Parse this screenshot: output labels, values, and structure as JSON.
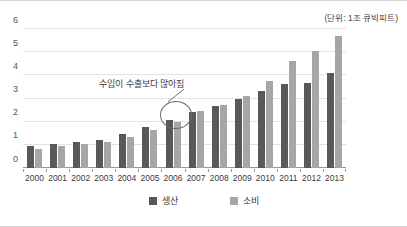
{
  "unit_caption": "(단위: 1조 큐빅피트)",
  "legend": {
    "production_label": "생산",
    "consumption_label": "소비"
  },
  "annotation": {
    "text": "수입이 수출보다 많아짐",
    "target_category": "2007"
  },
  "colors": {
    "production": "#595959",
    "consumption": "#a6a6a6",
    "gridline": "#e2e2e2",
    "axis": "#9a9a9a",
    "frame": "#d4d4d4"
  },
  "chart_data": {
    "type": "bar",
    "title": "",
    "subtitle": "",
    "xlabel": "",
    "ylabel": "",
    "unit": "(단위: 1조 큐빅피트)",
    "ylim": [
      0,
      6
    ],
    "yticks": [
      0,
      1,
      2,
      3,
      4,
      5,
      6
    ],
    "grid": true,
    "legend_position": "bottom",
    "categories": [
      "2000",
      "2001",
      "2002",
      "2003",
      "2004",
      "2005",
      "2006",
      "2007",
      "2008",
      "2009",
      "2010",
      "2011",
      "2012",
      "2013"
    ],
    "series": [
      {
        "name": "생산",
        "color": "#595959",
        "values": [
          0.95,
          1.05,
          1.13,
          1.19,
          1.45,
          1.75,
          2.06,
          2.41,
          2.69,
          2.96,
          3.32,
          3.61,
          3.65,
          4.11
        ]
      },
      {
        "name": "소비",
        "color": "#a6a6a6",
        "values": [
          0.83,
          0.96,
          1.02,
          1.12,
          1.32,
          1.63,
          1.98,
          2.44,
          2.7,
          3.09,
          3.76,
          4.6,
          5.03,
          5.71
        ]
      }
    ],
    "annotations": [
      {
        "text": "수입이 수출보다 많아짐",
        "points_to": "2007",
        "shape": "ellipse-with-leader-line"
      }
    ]
  }
}
